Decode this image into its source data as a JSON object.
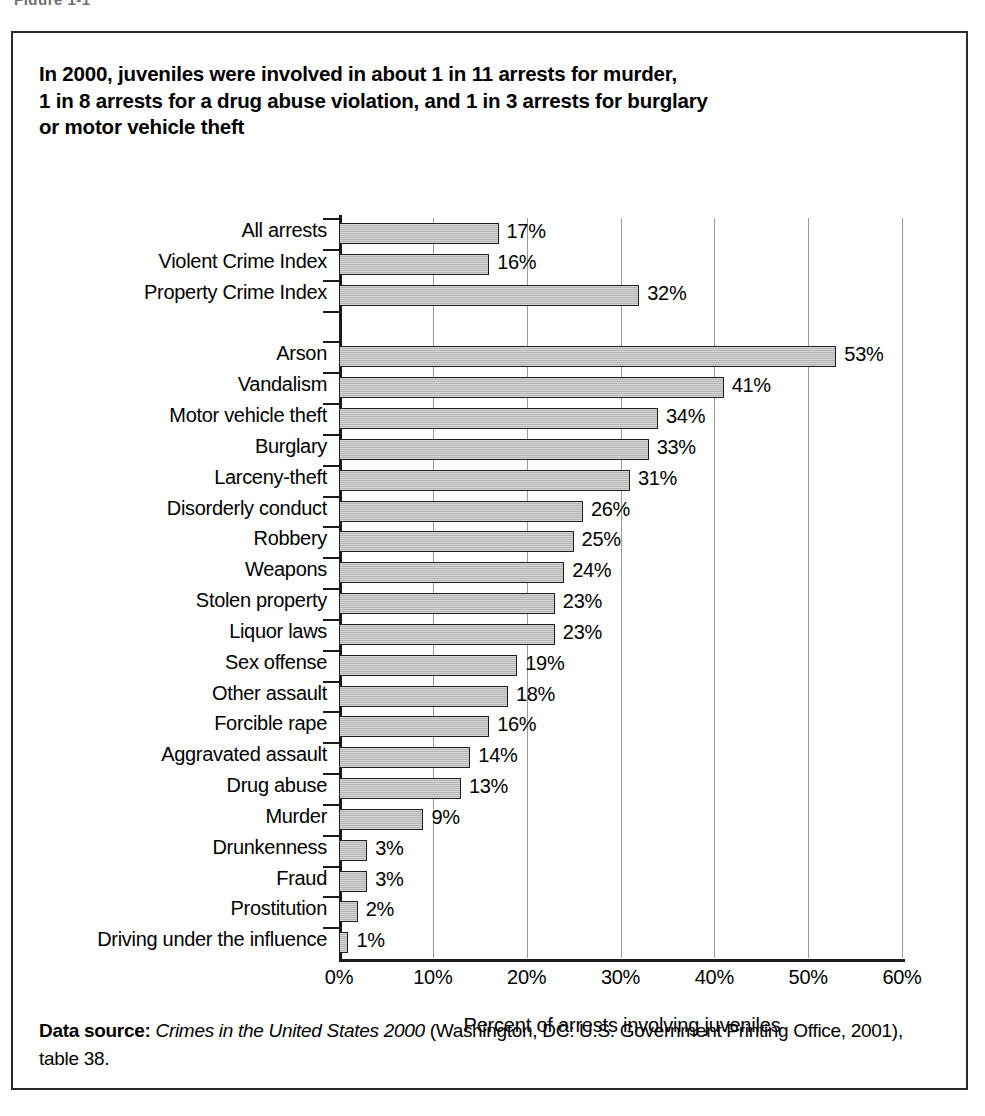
{
  "figure": {
    "caption_cut": "Figure 1-1",
    "headline_lines": [
      "In 2000, juveniles were involved in about 1 in 11 arrests for murder,",
      "1 in 8 arrests for a drug abuse violation, and 1 in 3 arrests for burglary",
      "or motor vehicle theft"
    ],
    "footer": {
      "label": "Data source:",
      "source_title": "Crimes in the United States 2000",
      "rest": " (Washington, DC: U.S. Government Printing Office, 2001), table 38."
    }
  },
  "chart_data": {
    "type": "bar",
    "orientation": "horizontal",
    "title": "In 2000, juveniles were involved in about 1 in 11 arrests for murder, 1 in 8 arrests for a drug abuse violation, and 1 in 3 arrests for burglary or motor vehicle theft",
    "xlabel": "Percent of arrests involving juveniles",
    "ylabel": "",
    "xlim": [
      0,
      60
    ],
    "xtick_labels": [
      "0%",
      "10%",
      "20%",
      "30%",
      "40%",
      "50%",
      "60%"
    ],
    "xticks": [
      0,
      10,
      20,
      30,
      40,
      50,
      60
    ],
    "grid": "vertical",
    "legend": "none",
    "bar_fill_color": "#b4b4b4",
    "bar_edge_color": "#1f1f1f",
    "categories": [
      "All arrests",
      "Violent Crime Index",
      "Property Crime Index",
      "",
      "Arson",
      "Vandalism",
      "Motor vehicle theft",
      "Burglary",
      "Larceny-theft",
      "Disorderly conduct",
      "Robbery",
      "Weapons",
      "Stolen property",
      "Liquor laws",
      "Sex offense",
      "Other assault",
      "Forcible rape",
      "Aggravated assault",
      "Drug abuse",
      "Murder",
      "Drunkenness",
      "Fraud",
      "Prostitution",
      "Driving under the influence"
    ],
    "values": [
      17,
      16,
      32,
      null,
      53,
      41,
      34,
      33,
      31,
      26,
      25,
      24,
      23,
      23,
      19,
      18,
      16,
      14,
      13,
      9,
      3,
      3,
      2,
      1
    ],
    "value_labels": [
      "17%",
      "16%",
      "32%",
      "",
      "53%",
      "41%",
      "34%",
      "33%",
      "31%",
      "26%",
      "25%",
      "24%",
      "23%",
      "23%",
      "19%",
      "18%",
      "16%",
      "14%",
      "13%",
      "9%",
      "3%",
      "3%",
      "2%",
      "1%"
    ]
  }
}
